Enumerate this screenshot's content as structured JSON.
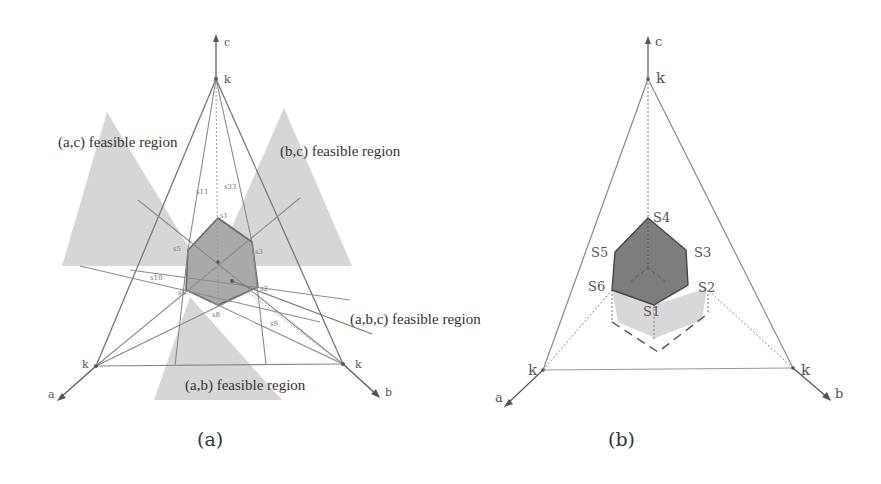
{
  "figure": {
    "panels": [
      {
        "id": "a",
        "caption": "(a)",
        "axes": {
          "a": "a",
          "b": "b",
          "c": "c"
        },
        "vertex_label": "k",
        "regions": {
          "ac": "(a,c) feasible region",
          "bc": "(b,c) feasible region",
          "ab": "(a,b) feasible region",
          "abc": "(a,b,c) feasible region"
        },
        "points": [
          "s11",
          "s33",
          "s1",
          "s2",
          "s3",
          "s5",
          "s6",
          "s8",
          "s9",
          "s10"
        ]
      },
      {
        "id": "b",
        "caption": "(b)",
        "axes": {
          "a": "a",
          "b": "b",
          "c": "c"
        },
        "vertex_label": "k",
        "points": {
          "s1": "S1",
          "s2": "S2",
          "s3": "S3",
          "s4": "S4",
          "s5": "S5",
          "s6": "S6"
        }
      }
    ],
    "colors": {
      "region_fill": "#d4d4d4",
      "polygon_fill": "#a8a8a8",
      "solid_fill": "#7a7a7a",
      "shadow_fill": "#d8d8d8",
      "line": "#777777"
    }
  }
}
